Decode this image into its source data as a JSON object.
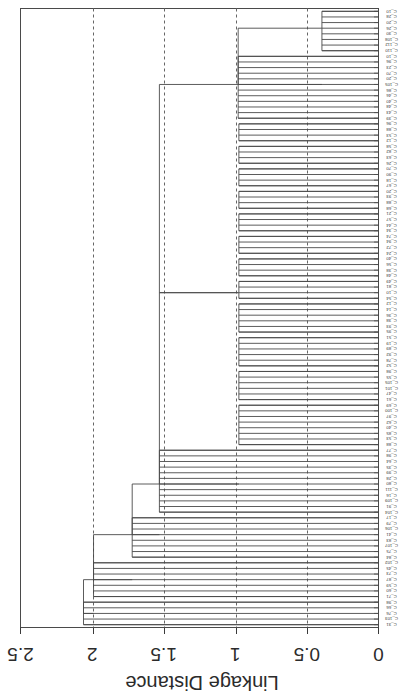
{
  "figure": {
    "kind": "dendrogram",
    "background_color": "#ffffff",
    "line_color": "#4a4a4a",
    "grid_color": "#555555",
    "axis_color": "#3a3a3a",
    "rotation_note": "plot is rendered rotated 180 degrees (upside-down page scan)"
  },
  "axes": {
    "value_axis_title": "Linkage Distance",
    "value_axis_ticks": [
      "2.5",
      "2",
      "1.5",
      "1",
      "0.5",
      "0"
    ],
    "value_axis_tick_values": [
      2.5,
      2,
      1.5,
      1,
      0.5,
      0
    ],
    "value_axis_min": 0,
    "value_axis_max": 2.5,
    "grid": "dashed vertical gridlines at 2, 1.5, 1, 0.5",
    "leaf_axis_ticks_count": 110
  },
  "chart_data": {
    "type": "dendrogram",
    "title": "",
    "xlabel": "Linkage Distance",
    "ylabel": "",
    "xlim": [
      2.5,
      0
    ],
    "grid": true,
    "legend": "none",
    "orientation": "horizontal-rotated-180",
    "n_leaves": 110,
    "leaf_labels": [
      "C_10",
      "C_28",
      "C_20",
      "C_26",
      "C_30",
      "C_108",
      "C_112",
      "C_110",
      "C_10",
      "C_96",
      "C_23",
      "C_70",
      "C_20",
      "C_105",
      "C_86",
      "C_46",
      "C_40",
      "C_48",
      "C_43",
      "C_39",
      "C_96",
      "C_88",
      "C_53",
      "C_12",
      "C_58",
      "C_82",
      "C_63",
      "C_26",
      "C_70",
      "C_90",
      "C_18",
      "C_67",
      "C_20",
      "C_93",
      "C_88",
      "C_68",
      "C_21",
      "C_57",
      "C_44",
      "C_34",
      "C_74",
      "C_94",
      "C_72",
      "C_24",
      "C_40",
      "C_56",
      "C_38",
      "C_48",
      "C_49",
      "C_81",
      "C_10",
      "C_54",
      "C_12",
      "C_14",
      "C_36",
      "C_38",
      "C_93",
      "C_95",
      "C_51",
      "C_19",
      "C_89",
      "C_92",
      "C_78",
      "C_52",
      "C_98",
      "C_55",
      "C_105",
      "C_101",
      "C_47",
      "C_61",
      "C_69",
      "C_100",
      "C_97",
      "C_62",
      "C_40",
      "C_85",
      "C_53",
      "C_88",
      "C_77",
      "C_98",
      "C_64",
      "C_35",
      "C_99",
      "C_28",
      "C_80",
      "C_111",
      "C_16",
      "C_109",
      "C_91",
      "C_104",
      "C_17",
      "C_79",
      "C_106",
      "C_41",
      "C_83",
      "C_107",
      "C_75",
      "C_84",
      "C_102",
      "C_45",
      "C_73",
      "C_87",
      "C_59",
      "C_60",
      "C_71",
      "C_98",
      "C_66",
      "C_76",
      "C_103",
      "C_31"
    ],
    "merges": [
      {
        "id": 0,
        "height": 0.395,
        "span_leaves": [
          0,
          7
        ]
      },
      {
        "id": 1,
        "height": 0.98,
        "span_leaves": [
          8,
          19
        ]
      },
      {
        "id": 2,
        "height": 0.975,
        "span_leaves": [
          20,
          23
        ]
      },
      {
        "id": 3,
        "height": 0.975,
        "span_leaves": [
          24,
          27
        ]
      },
      {
        "id": 4,
        "height": 0.975,
        "span_leaves": [
          28,
          31
        ]
      },
      {
        "id": 5,
        "height": 0.975,
        "span_leaves": [
          32,
          35
        ]
      },
      {
        "id": 6,
        "height": 0.975,
        "span_leaves": [
          36,
          39
        ]
      },
      {
        "id": 7,
        "height": 0.975,
        "span_leaves": [
          40,
          43
        ]
      },
      {
        "id": 8,
        "height": 0.975,
        "span_leaves": [
          44,
          47
        ]
      },
      {
        "id": 9,
        "height": 0.975,
        "span_leaves": [
          48,
          51
        ]
      },
      {
        "id": 10,
        "height": 0.975,
        "span_leaves": [
          52,
          57
        ]
      },
      {
        "id": 11,
        "height": 0.975,
        "span_leaves": [
          58,
          63
        ]
      },
      {
        "id": 12,
        "height": 0.975,
        "span_leaves": [
          64,
          69
        ]
      },
      {
        "id": 13,
        "height": 0.975,
        "span_leaves": [
          70,
          77
        ]
      },
      {
        "id": 14,
        "height": 1.53,
        "span_leaves": [
          78,
          89
        ]
      },
      {
        "id": 15,
        "height": 1.72,
        "span_leaves": [
          90,
          97
        ]
      },
      {
        "id": 16,
        "height": 1.99,
        "span_leaves": [
          98,
          104
        ]
      },
      {
        "id": 17,
        "height": 2.06,
        "span_leaves": [
          105,
          109
        ]
      }
    ],
    "cluster_bars_value": [
      1.0,
      1.0,
      1.0,
      1.0,
      1.0,
      1.0,
      1.0,
      1.0,
      1.0,
      1.0,
      1.0,
      1.0,
      1.0,
      1.0,
      1.0,
      1.0,
      1.0,
      1.0,
      1.0,
      1.0,
      1.0,
      1.0,
      1.0,
      1.0,
      1.0,
      1.0,
      1.0,
      1.0,
      1.0,
      1.0,
      1.0,
      1.0,
      1.0,
      1.0,
      1.0,
      1.0,
      1.0,
      1.0,
      1.0,
      1.0,
      1.5,
      1.5,
      1.7,
      1.7,
      2.0,
      2.05
    ]
  }
}
